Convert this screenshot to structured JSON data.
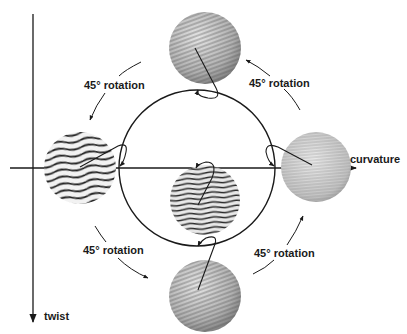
{
  "axes": {
    "horizontal_label": "curvature",
    "vertical_label": "twist"
  },
  "rotation_labels": [
    {
      "text": "45° rotation",
      "position": "upper-left"
    },
    {
      "text": "45° rotation",
      "position": "upper-right"
    },
    {
      "text": "45° rotation",
      "position": "lower-left"
    },
    {
      "text": "45° rotation",
      "position": "lower-right"
    }
  ],
  "spheres": [
    {
      "name": "top",
      "pattern": "fine-diagonal-stripes"
    },
    {
      "name": "left",
      "pattern": "coarse-wavy-stripes"
    },
    {
      "name": "right",
      "pattern": "fine-horizontal-stripes"
    },
    {
      "name": "center",
      "pattern": "coarse-horizontal-stripes"
    },
    {
      "name": "bottom",
      "pattern": "fine-diagonal-stripes"
    }
  ],
  "colors": {
    "line": "#1a1a1a",
    "sphere_light": "#d8d8d8",
    "sphere_dark": "#6a6a6a"
  }
}
